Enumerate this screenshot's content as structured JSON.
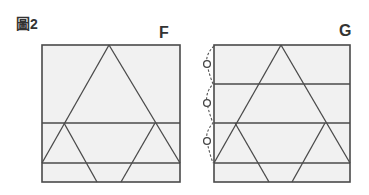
{
  "figure": {
    "title": "圖2",
    "panels": [
      {
        "label": "F",
        "square": {
          "x": 42,
          "y": 45,
          "w": 138,
          "h": 137
        },
        "fill": "#f1f1f1",
        "stroke": "#444444",
        "horizontal_lines_y": [
          123,
          163
        ],
        "big_triangle": {
          "apex": [
            109,
            45
          ],
          "base_left": [
            42,
            163
          ],
          "base_right": [
            180,
            163
          ]
        },
        "small_triangles": [
          {
            "apex": [
              64,
              123
            ],
            "left": [
              42,
              163
            ],
            "bottom": [
              97,
              182
            ]
          },
          {
            "apex": [
              155,
              123
            ],
            "right": [
              180,
              163
            ],
            "bottom": [
              121,
              182
            ]
          }
        ]
      },
      {
        "label": "G",
        "square": {
          "x": 214,
          "y": 45,
          "w": 136,
          "h": 137
        },
        "fill": "#f1f1f1",
        "stroke": "#444444",
        "horizontal_lines_y": [
          84,
          123,
          163
        ],
        "big_triangle": {
          "apex": [
            281,
            45
          ],
          "base_left": [
            214,
            163
          ],
          "base_right": [
            350,
            163
          ]
        },
        "small_triangles": [
          {
            "apex": [
              235,
              123
            ],
            "left": [
              214,
              163
            ],
            "bottom": [
              269,
              182
            ]
          },
          {
            "apex": [
              325,
              123
            ],
            "right": [
              350,
              163
            ],
            "bottom": [
              292,
              182
            ]
          }
        ],
        "annotation": {
          "type": "dashed-brace-with-circles",
          "circle_marks": [
            "O",
            "O",
            "O"
          ],
          "circle_centers_y": [
            64,
            103,
            141
          ],
          "circle_x": 207
        }
      }
    ]
  }
}
